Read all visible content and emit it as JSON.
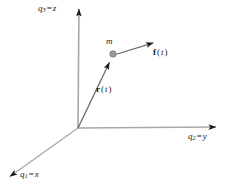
{
  "figure": {
    "background_color": "#ffffff",
    "axis_color": "#a8a8a8",
    "vector_color": "#6b6b6b",
    "arrowhead_color": "#1a1a1a",
    "mass_dot_color": "#9a9a9a",
    "mass_dot_edge_color": "#7a7a7a",
    "text_color": "#1a1a1a"
  },
  "axes": {
    "z": {
      "symbol": "q",
      "subscript": "3",
      "equals": "=",
      "alias": "z",
      "origin": [
        78,
        128
      ],
      "tip": [
        79,
        3
      ]
    },
    "y": {
      "symbol": "q",
      "subscript": "2",
      "equals": "=",
      "alias": "y",
      "origin": [
        78,
        128
      ],
      "tip": [
        222,
        127
      ]
    },
    "x": {
      "symbol": "q",
      "subscript": "1",
      "equals": "=",
      "alias": "x",
      "origin": [
        78,
        128
      ],
      "tip": [
        5,
        180
      ]
    }
  },
  "vectors": {
    "r": {
      "label_bold": "r",
      "label_rest": "(t)",
      "label_arg": "t",
      "from": [
        78,
        128
      ],
      "to": [
        112,
        57
      ]
    },
    "f": {
      "label_bold": "f",
      "label_rest": "(t)",
      "label_arg": "t",
      "from": [
        114,
        55
      ],
      "to": [
        159,
        41
      ]
    }
  },
  "mass": {
    "label": "m",
    "position": [
      113,
      54
    ],
    "radius": 3.2
  }
}
